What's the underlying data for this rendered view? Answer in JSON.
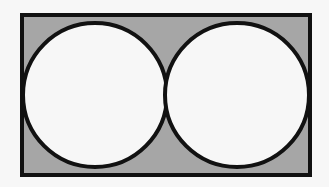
{
  "figure": {
    "shapes": {
      "rectangle": {
        "fill": "#a6a6a6",
        "stroke": "#111111"
      },
      "circles": [
        {
          "label": "left-circle",
          "fill": "#f7f7f7",
          "stroke": "#111111"
        },
        {
          "label": "right-circle",
          "fill": "#f7f7f7",
          "stroke": "#111111"
        }
      ]
    },
    "relationships": {
      "circles_tangent_to_each_other": true,
      "circles_tangent_to_rectangle_sides": true,
      "circle_count": 2
    }
  }
}
